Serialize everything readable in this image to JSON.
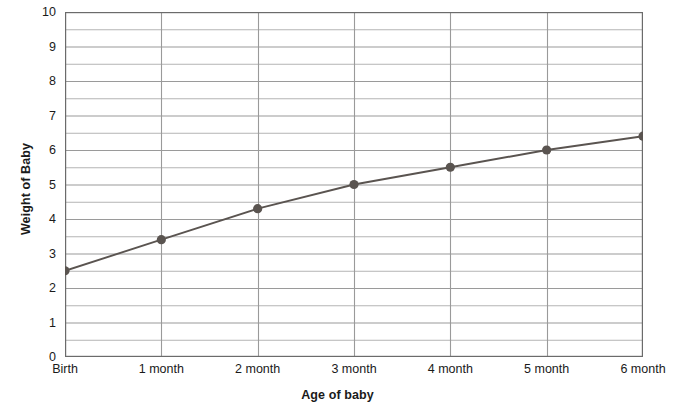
{
  "chart_data": {
    "type": "line",
    "title": "",
    "xlabel": "Age of baby",
    "ylabel": "Weight of Baby",
    "categories": [
      "Birth",
      "1 month",
      "2 month",
      "3 month",
      "4 month",
      "5 month",
      "6 month"
    ],
    "values": [
      2.5,
      3.4,
      4.3,
      5.0,
      5.5,
      6.0,
      6.4
    ],
    "series": [
      {
        "name": "Weight of Baby",
        "values": [
          2.5,
          3.4,
          4.3,
          5.0,
          5.5,
          6.0,
          6.4
        ]
      }
    ],
    "ylim": [
      0,
      10
    ],
    "y_major_ticks": [
      0,
      1,
      2,
      3,
      4,
      5,
      6,
      7,
      8,
      9,
      10
    ],
    "y_minor_step": 0.5,
    "y_tick_labels": [
      "0",
      "1",
      "2",
      "3",
      "4",
      "5",
      "6",
      "7",
      "8",
      "9",
      "10"
    ],
    "grid": "horizontal-and-vertical",
    "legend": "none",
    "marker": "circle",
    "colors": {
      "line": "#5a5450",
      "marker": "#5a5450",
      "gridline": "#9a9a9a",
      "minor_gridline": "#b4b4b4",
      "axis": "#5a5a5a",
      "text": "#1a1a1a",
      "background": "#ffffff"
    }
  }
}
